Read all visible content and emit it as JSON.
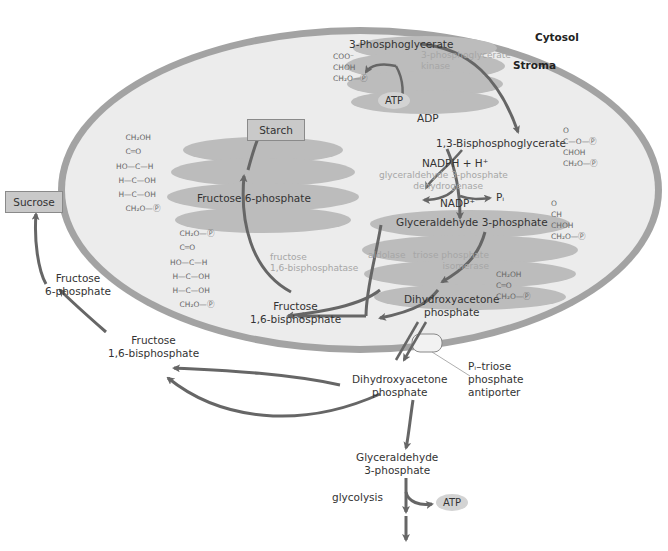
{
  "compartments": {
    "cytosol": "Cytosol",
    "stroma": "Stroma"
  },
  "stroma_pathway": {
    "pga": "3-Phosphoglycerate",
    "pga_kinase": [
      "3-phosphoglycerate",
      "kinase"
    ],
    "atp": "ATP",
    "adp": "ADP",
    "bpg": "1,3-Bisphosphoglycerate",
    "nadph": "NADPH + H⁺",
    "nadp": "NADP⁺",
    "pi": "Pᵢ",
    "g3p_dehydrogenase": [
      "glyceraldehyde 3-phosphate",
      "dehydrogenase"
    ],
    "g3p": "Glyceraldehyde 3-phosphate",
    "aldolase": "aldolase",
    "tpi": [
      "triose phosphate",
      "isomerase"
    ],
    "dhap": [
      "Dihydroxyacetone",
      "phosphate"
    ],
    "fbp": [
      "Fructose",
      "1,6-bisphosphate"
    ],
    "fbpase": [
      "fructose",
      "1,6-bisphosphatase"
    ],
    "f6p": "Fructose 6-phosphate",
    "starch": "Starch"
  },
  "structures": {
    "pga": [
      "COO⁻",
      "|",
      "CHOH",
      "|",
      "CH₂O—Ⓟ"
    ],
    "bpg": [
      "O",
      "‖",
      "C—O—Ⓟ",
      "|",
      "CHOH",
      "|",
      "CH₂O—Ⓟ"
    ],
    "g3p": [
      "O",
      "‖",
      "CH",
      "|",
      "CHOH",
      "|",
      "CH₂O—Ⓟ"
    ],
    "dhap": [
      "CH₂OH",
      "|",
      "C═O",
      "|",
      "CH₂O—Ⓟ"
    ],
    "f6p": [
      "    CH₂OH",
      "    |",
      "    C═O",
      "    |",
      "HO—C—H",
      "    |",
      " H—C—OH",
      "    |",
      " H—C—OH",
      "    |",
      "    CH₂O—Ⓟ"
    ],
    "fbp": [
      "    CH₂O—Ⓟ",
      "    |",
      "    C═O",
      "    |",
      "HO—C—H",
      "    |",
      " H—C—OH",
      "    |",
      " H—C—OH",
      "    |",
      "    CH₂O—Ⓟ"
    ]
  },
  "cytosol_pathway": {
    "sucrose": "Sucrose",
    "f6p": [
      "Fructose",
      "6-phosphate"
    ],
    "fbp": [
      "Fructose",
      "1,6-bisphosphate"
    ],
    "dhap": [
      "Dihydroxyacetone",
      "phosphate"
    ],
    "g3p": [
      "Glyceraldehyde",
      "3-phosphate"
    ],
    "glycolysis": "glycolysis",
    "atp": "ATP",
    "antiporter": [
      "Pᵢ–triose",
      "phosphate",
      "antiporter"
    ]
  },
  "colors": {
    "membrane": "#a0a0a0",
    "stroma_fill": "#ececec",
    "enzyme_blob": "#bdbdbd",
    "arrow": "#666666",
    "box_fill": "#c9c9c9"
  }
}
